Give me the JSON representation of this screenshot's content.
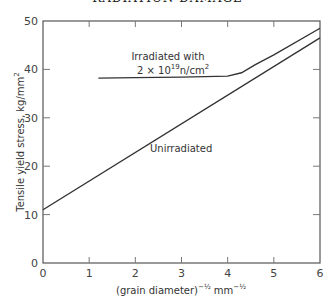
{
  "page": {
    "running_header": "RADIATION DAMAGE"
  },
  "chart_data": {
    "type": "line",
    "title": "",
    "xlabel": "(grain diameter)^-1/2  mm^-1/2",
    "xlabel_parts": {
      "base": "(grain diameter)",
      "exp1": "−½",
      "unit": "mm",
      "exp2": "−½"
    },
    "ylabel": "Tensile yield stress, kg/mm²",
    "xlim": [
      0,
      6
    ],
    "ylim": [
      0,
      50
    ],
    "xticks": [
      0,
      1,
      2,
      3,
      4,
      5,
      6
    ],
    "yticks": [
      0,
      10,
      20,
      30,
      40,
      50
    ],
    "grid": false,
    "legend": "none (inline annotations)",
    "series": [
      {
        "name": "Unirradiated",
        "x": [
          0,
          6
        ],
        "y": [
          11,
          46.5
        ]
      },
      {
        "name": "Irradiated with 2 × 10^19 n/cm²",
        "x": [
          1.2,
          2.0,
          3.0,
          4.0,
          4.3,
          4.6,
          5.0,
          6.0
        ],
        "y": [
          38.2,
          38.3,
          38.4,
          38.6,
          39.3,
          41.0,
          43.0,
          48.5
        ]
      }
    ],
    "annotations": [
      {
        "text": "Irradiated with",
        "x": 2.8,
        "y": 42
      },
      {
        "text": "2 × 10^19 n/cm^2",
        "x": 2.8,
        "y": 39.5
      },
      {
        "text": "Unirradiated",
        "x": 3.2,
        "y": 19
      }
    ]
  },
  "labels": {
    "ann_irr1": "Irradiated with",
    "ann_irr2_a": "2 × 10",
    "ann_irr2_exp": "19",
    "ann_irr2_b": "n/cm",
    "ann_irr2_exp2": "2",
    "ann_unirr": "Unirradiated",
    "ylabel": "Tensile yield stress, kg/mm",
    "ylabel_exp": "2",
    "xlabel_base": "(grain diameter)",
    "xlabel_exp1": "−½",
    "xlabel_unit": "mm",
    "xlabel_exp2": "−½"
  }
}
